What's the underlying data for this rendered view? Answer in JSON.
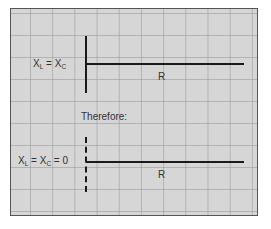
{
  "diagram": {
    "top": {
      "equation": {
        "x": "X",
        "sub_l": "L",
        "eq": " = ",
        "x2": "X",
        "sub_c": "C",
        "tail": ""
      },
      "resistance_label": "R"
    },
    "middle_caption": "Therefore:",
    "bottom": {
      "equation": {
        "x": "X",
        "sub_l": "L",
        "eq": " = ",
        "x2": "X",
        "sub_c": "C",
        "tail": " = 0"
      },
      "resistance_label": "R"
    },
    "colors": {
      "background": "#d6d6d6",
      "grid": "#969696",
      "lines": "#1a1a1a",
      "text": "#333333"
    }
  }
}
